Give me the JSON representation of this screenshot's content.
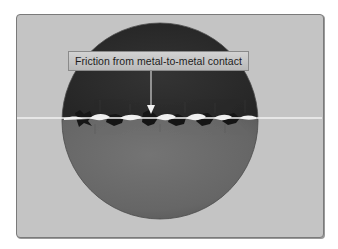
{
  "diagram": {
    "type": "magnified cross-section",
    "label": {
      "text": "Friction from metal-to-metal contact",
      "points_to": "contact-interface"
    },
    "colors": {
      "background_panel": "#c4c4c4",
      "upper_metal": "#2e2e2e",
      "lower_metal": "#6a6a6a",
      "contact_line": "#f2f2f2",
      "label_box": "#c6c6c6",
      "arrow": "#f2f2f2"
    }
  }
}
